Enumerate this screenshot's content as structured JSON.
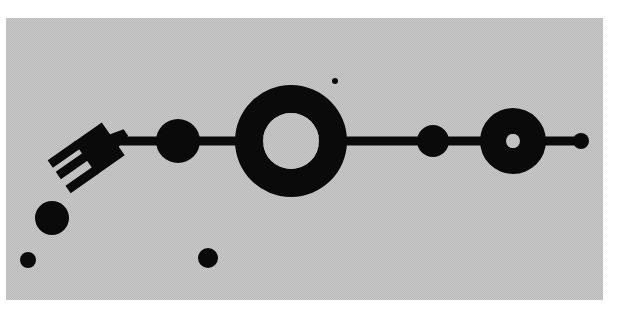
{
  "artwork": {
    "canvas": {
      "width": 624,
      "height": 319,
      "background": "#ffffff"
    },
    "panel": {
      "x": 6,
      "y": 18,
      "width": 597,
      "height": 282,
      "fill": "#c9c9c9",
      "dot": "#b4b4b4"
    },
    "ink": "#0a0a0a",
    "bar": {
      "x1": 118,
      "x2": 582,
      "y": 141,
      "thickness": 9
    },
    "shapes": [
      {
        "id": "circle-a",
        "type": "circle",
        "cx": 178,
        "cy": 141,
        "r": 22
      },
      {
        "id": "large-ring",
        "type": "ring",
        "cx": 291,
        "cy": 141,
        "r": 56,
        "inner_r": 28
      },
      {
        "id": "circle-b",
        "type": "circle",
        "cx": 433,
        "cy": 141,
        "r": 16
      },
      {
        "id": "small-ring",
        "type": "ring",
        "cx": 513,
        "cy": 141,
        "r": 33,
        "inner_r": 7
      },
      {
        "id": "end-dot",
        "type": "circle",
        "cx": 581,
        "cy": 141,
        "r": 8
      },
      {
        "id": "tiny-dot",
        "type": "circle",
        "cx": 335,
        "cy": 81,
        "r": 3
      },
      {
        "id": "left-circle",
        "type": "circle",
        "cx": 52,
        "cy": 218,
        "r": 17
      },
      {
        "id": "corner-dot",
        "type": "circle",
        "cx": 28,
        "cy": 260,
        "r": 8
      },
      {
        "id": "bottom-dot",
        "type": "circle",
        "cx": 208,
        "cy": 258,
        "r": 10
      }
    ]
  }
}
